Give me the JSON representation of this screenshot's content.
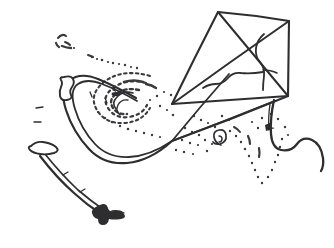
{
  "image": {
    "title": "Kite",
    "caption": "Line drawing of a diamond kite flying with a bowed tail and wind swirls",
    "style": "black and white pen-and-ink line drawing",
    "background_color": "#ffffff",
    "ink_color": "#2e2e30",
    "stipple_color": "#3a3a3c",
    "width": 334,
    "height": 248
  },
  "objects": {
    "kite_body": {
      "name": "kite-sail",
      "shape": "diamond quadrilateral",
      "vertices": [
        {
          "label": "top",
          "x": 218,
          "y": 12
        },
        {
          "label": "right",
          "x": 289,
          "y": 21
        },
        {
          "label": "bottom-right",
          "x": 288,
          "y": 96
        },
        {
          "label": "left",
          "x": 172,
          "y": 104
        }
      ],
      "spars": [
        {
          "label": "spine",
          "from": "top",
          "to": "bottom-right"
        },
        {
          "label": "spar",
          "from": "right",
          "to": "left"
        }
      ]
    },
    "sail_crease": {
      "name": "sail-crease-line",
      "description": "irregular creased fold line across the kite sail"
    },
    "bridle": {
      "name": "bridle-lines",
      "description": "three converging bridle strings from the sail to the tow point",
      "tow_point": {
        "x": 172,
        "y": 141
      },
      "line_count": 3
    },
    "tail": {
      "name": "kite-tail",
      "description": "long S-curved tail sweeping left and down",
      "bows": [
        {
          "label": "upper-bow",
          "x": 69,
          "y": 85
        },
        {
          "label": "lower-bow",
          "x": 44,
          "y": 150
        },
        {
          "label": "end-knot",
          "x": 105,
          "y": 215
        }
      ]
    },
    "streamer": {
      "name": "side-streamer",
      "description": "wavy ribbon streamer trailing from the lower right of the kite"
    },
    "wind_marks": {
      "name": "wind-swirl-stipple",
      "description": "dotted stippled swirls indicating moving air",
      "clusters": 5
    }
  }
}
